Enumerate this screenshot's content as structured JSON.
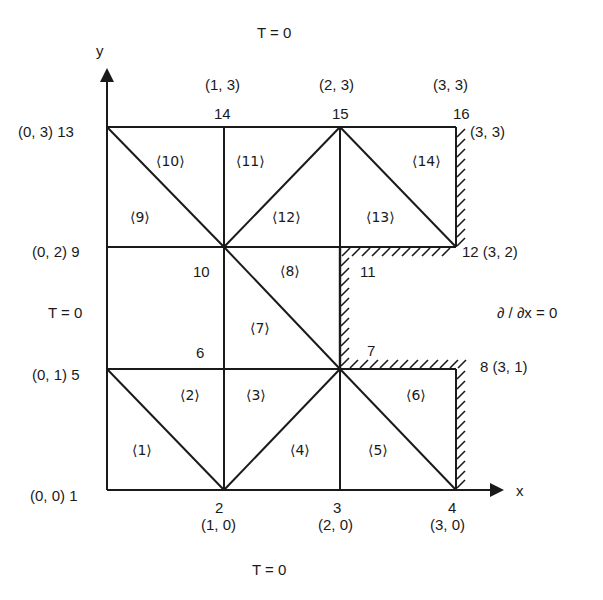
{
  "axes": {
    "x_label": "x",
    "y_label": "y"
  },
  "boundary_conditions": {
    "top": "T = 0",
    "bottom": "T = 0",
    "left": "T = 0",
    "right": "∂ / ∂x = 0"
  },
  "nodes": [
    {
      "id": "1",
      "label": "(0, 0) 1"
    },
    {
      "id": "2",
      "label": "2",
      "coord": "(1, 0)"
    },
    {
      "id": "3",
      "label": "3",
      "coord": "(2, 0)"
    },
    {
      "id": "4",
      "label": "4",
      "coord": "(3, 0)"
    },
    {
      "id": "5",
      "label": "(0, 1) 5"
    },
    {
      "id": "6",
      "label": "6"
    },
    {
      "id": "7",
      "label": "7"
    },
    {
      "id": "8",
      "label": "8 (3, 1)"
    },
    {
      "id": "9",
      "label": "(0, 2) 9"
    },
    {
      "id": "10",
      "label": "10"
    },
    {
      "id": "11",
      "label": "11"
    },
    {
      "id": "12",
      "label": "12 (3, 2)"
    },
    {
      "id": "13",
      "label": "(0, 3) 13"
    },
    {
      "id": "14",
      "label": "14",
      "coord": "(1, 3)"
    },
    {
      "id": "15",
      "label": "15",
      "coord": "(2, 3)"
    },
    {
      "id": "16",
      "label": "16",
      "coord": "(3, 3)",
      "coord2": "(3, 3)"
    }
  ],
  "elements": [
    "⟨1⟩",
    "⟨2⟩",
    "⟨3⟩",
    "⟨4⟩",
    "⟨5⟩",
    "⟨6⟩",
    "⟨7⟩",
    "⟨8⟩",
    "⟨9⟩",
    "⟨10⟩",
    "⟨11⟩",
    "⟨12⟩",
    "⟨13⟩",
    "⟨14⟩"
  ],
  "colors": {
    "line": "#1a1a1a",
    "background": "#ffffff"
  }
}
